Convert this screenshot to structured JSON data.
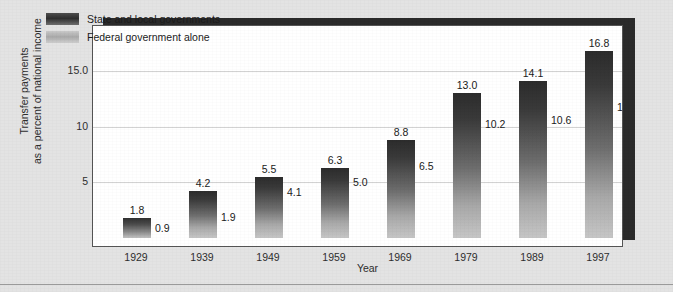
{
  "chart_data": {
    "type": "bar",
    "title": "",
    "xlabel": "Year",
    "ylabel": "Transfer payments as a percent of national income",
    "ylabel_line1": "Transfer payments",
    "ylabel_line2": "as a percent of national income",
    "categories": [
      "1929",
      "1939",
      "1949",
      "1959",
      "1969",
      "1979",
      "1989",
      "1997"
    ],
    "ylim": [
      0,
      18.5
    ],
    "yticks": [
      "5",
      "10",
      "15.0"
    ],
    "ytick_values": [
      5,
      10,
      15
    ],
    "grid": true,
    "legend_position": "top-left",
    "series": [
      {
        "name": "State and local governments",
        "color": "#333333",
        "values": [
          1.8,
          4.2,
          5.5,
          6.3,
          8.8,
          13.0,
          14.1,
          16.8
        ],
        "labels": [
          "1.8",
          "4.2",
          "5.5",
          "6.3",
          "8.8",
          "13.0",
          "14.1",
          "16.8"
        ]
      },
      {
        "name": "Federal government alone",
        "color": "#b0b0b0",
        "values": [
          0.9,
          1.9,
          4.1,
          5.0,
          6.5,
          10.2,
          10.6,
          11.8
        ],
        "labels": [
          "0.9",
          "1.9",
          "4.1",
          "5.0",
          "6.5",
          "10.2",
          "10.6",
          "11.8"
        ]
      }
    ]
  },
  "legend": {
    "items": [
      {
        "label": "State and local governments"
      },
      {
        "label": "Federal government alone"
      }
    ]
  }
}
